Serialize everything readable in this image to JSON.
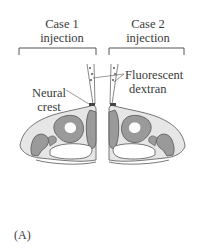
{
  "figure": {
    "panel_label": "(A)",
    "case1": {
      "line1": "Case 1",
      "line2": "injection"
    },
    "case2": {
      "line1": "Case 2",
      "line2": "injection"
    },
    "labels": {
      "neural_crest_line1": "Neural",
      "neural_crest_line2": "crest",
      "dextran_line1": "Fluorescent",
      "dextran_line2": "dextran"
    },
    "colors": {
      "tissue_light": "#e6e6e6",
      "tissue_dark": "#9a9a9a",
      "outline": "#555555",
      "neural_crest_mark": "#444444"
    }
  }
}
